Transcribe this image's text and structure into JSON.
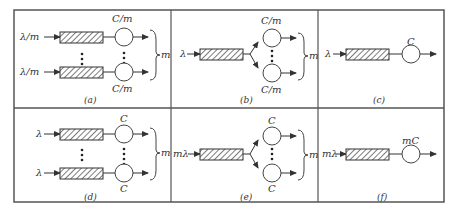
{
  "panels": [
    {
      "id": "a",
      "caption": "(a)",
      "input_top": "λ/m",
      "input_bottom": "λ/m",
      "server_top": "C/m",
      "server_bottom": "C/m",
      "brace": "m"
    },
    {
      "id": "b",
      "caption": "(b)",
      "input": "λ",
      "server_top": "C/m",
      "server_bottom": "C/m",
      "brace": "m"
    },
    {
      "id": "c",
      "caption": "(c)",
      "input": "λ",
      "server": "C"
    },
    {
      "id": "d",
      "caption": "(d)",
      "input_top": "λ",
      "input_bottom": "λ",
      "server_top": "C",
      "server_bottom": "C",
      "brace": "m"
    },
    {
      "id": "e",
      "caption": "(e)",
      "input": "mλ",
      "server_top": "C",
      "server_bottom": "C",
      "brace": "m"
    },
    {
      "id": "f",
      "caption": "(f)",
      "input": "mλ",
      "server": "mC"
    }
  ]
}
